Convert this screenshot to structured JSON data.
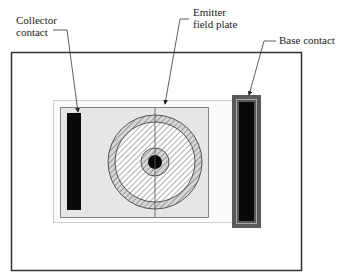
{
  "diagram": {
    "labels": {
      "collector": [
        "Collector",
        "contact"
      ],
      "emitter": [
        "Emitter",
        "field plate"
      ],
      "base": "Base contact"
    },
    "colors": {
      "frame": "#333333",
      "substrate": "#e6e6e6",
      "outline": "#cfcfcf",
      "contact": "#0a0a0a",
      "base_ring": "#5a5a5a",
      "hatch": "#777777"
    }
  }
}
